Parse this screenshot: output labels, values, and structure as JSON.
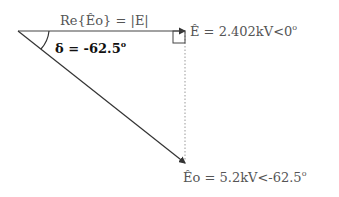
{
  "diagram": {
    "type": "phasor-diagram",
    "labels": {
      "real_part": "Re{Êo} = |E|",
      "angle_prefix": "δ = -62.5",
      "angle_sup": "o",
      "e_phasor_prefix": "Ê = 2.402kV<0",
      "e_phasor_sup": "o",
      "eo_phasor_prefix": "Êo = 5.2kV<-62.5",
      "eo_phasor_sup": "o"
    },
    "phasors": [
      {
        "name": "E",
        "magnitude": "2.402kV",
        "angle_deg": 0
      },
      {
        "name": "Eo",
        "magnitude": "5.2kV",
        "angle_deg": -62.5
      }
    ],
    "colors": {
      "line": "#333333",
      "text": "#555555",
      "dotted": "#999999"
    }
  }
}
